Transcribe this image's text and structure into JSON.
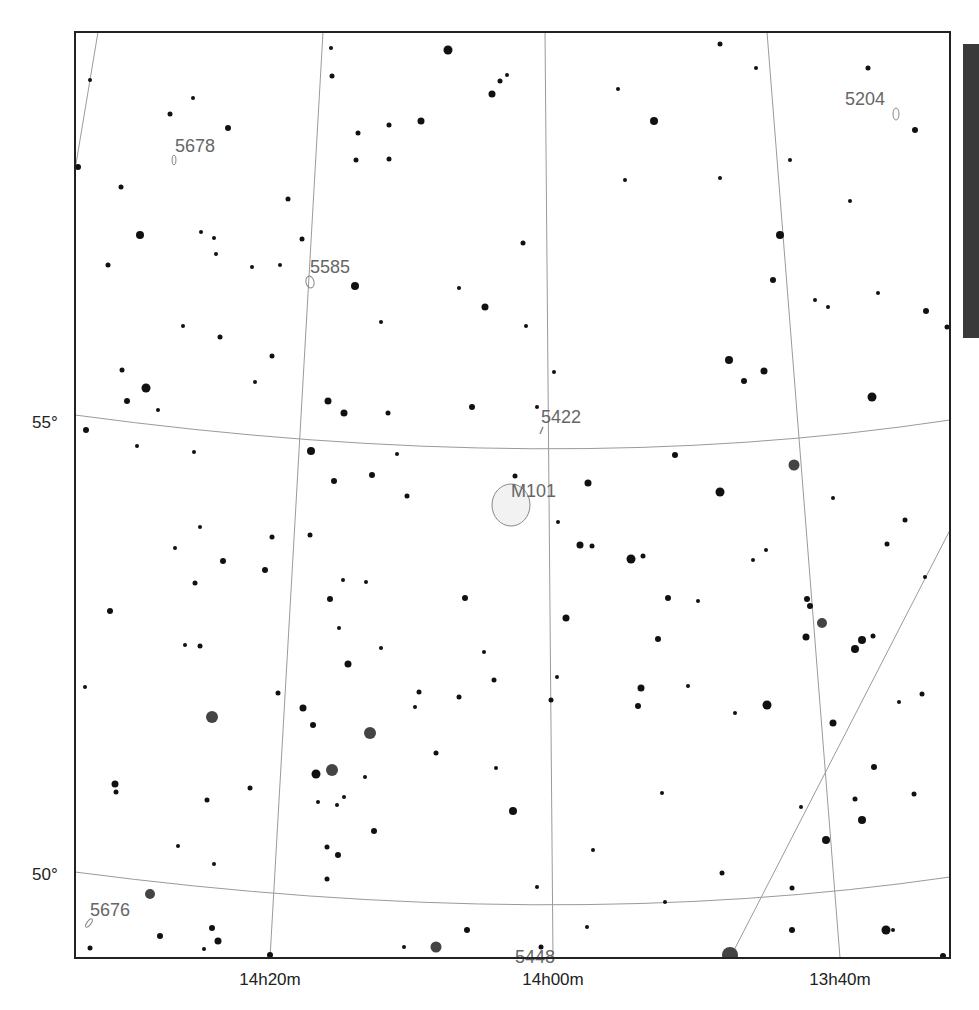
{
  "chart": {
    "frame": {
      "x": 75,
      "y": 32,
      "w": 875,
      "h": 926
    },
    "colors": {
      "frame": "#222222",
      "grid": "#9a9a9a",
      "star": "#111111",
      "star_dim": "#444444",
      "label": "#666666",
      "galaxy_fill": "#f2f2f2",
      "galaxy_stroke": "#888888",
      "side_bar": "#3a3a3a"
    },
    "dec_labels": [
      {
        "text": "55°",
        "x": 32,
        "y": 428
      },
      {
        "text": "50°",
        "x": 32,
        "y": 880
      }
    ],
    "ra_labels": [
      {
        "text": "14h20m",
        "x": 270,
        "y": 985
      },
      {
        "text": "14h00m",
        "x": 553,
        "y": 985
      },
      {
        "text": "13h40m",
        "x": 840,
        "y": 985
      }
    ],
    "grid_lines": [
      {
        "name": "ra-14h30m",
        "d": "M98,32 L75,170"
      },
      {
        "name": "ra-14h20m",
        "d": "M323,32 L270,958"
      },
      {
        "name": "ra-14h00m",
        "d": "M545,32 L553,958"
      },
      {
        "name": "ra-13h40m",
        "d": "M767,32 L840,958"
      },
      {
        "name": "dec-55",
        "d": "M75,415 Q553,480 950,420"
      },
      {
        "name": "dec-50",
        "d": "M75,872 Q553,935 950,877"
      },
      {
        "name": "boundary-line",
        "d": "M730,958 L950,530"
      }
    ],
    "objects": [
      {
        "label": "5678",
        "lx": 175,
        "ly": 152,
        "shape": "ellipse",
        "cx": 174,
        "cy": 160,
        "rx": 2,
        "ry": 5,
        "rot": 0
      },
      {
        "label": "5585",
        "lx": 310,
        "ly": 273,
        "shape": "ellipse",
        "cx": 310,
        "cy": 282,
        "rx": 4,
        "ry": 6,
        "rot": -15
      },
      {
        "label": "5204",
        "lx": 845,
        "ly": 105,
        "shape": "ellipse",
        "cx": 896,
        "cy": 114,
        "rx": 3,
        "ry": 6,
        "rot": 0
      },
      {
        "label": "5422",
        "lx": 541,
        "ly": 423,
        "shape": "line",
        "x1": 540,
        "y1": 434,
        "x2": 543,
        "y2": 427
      },
      {
        "label": "M101",
        "lx": 511,
        "ly": 497,
        "shape": "ellipse",
        "cx": 511,
        "cy": 505,
        "rx": 19,
        "ry": 21,
        "rot": 0
      },
      {
        "label": "5676",
        "lx": 90,
        "ly": 916,
        "shape": "ellipse",
        "cx": 89,
        "cy": 923,
        "rx": 2,
        "ry": 5,
        "rot": 35
      },
      {
        "label": "5448",
        "lx": 515,
        "ly": 963,
        "shape": "none"
      }
    ],
    "stars": [
      [
        90,
        80,
        2
      ],
      [
        170,
        114,
        2.5
      ],
      [
        193,
        98,
        2
      ],
      [
        228,
        128,
        3
      ],
      [
        121,
        187,
        2.5
      ],
      [
        78,
        167,
        3
      ],
      [
        140,
        235,
        4
      ],
      [
        108,
        265,
        2.5
      ],
      [
        201,
        232,
        2
      ],
      [
        214,
        238,
        2
      ],
      [
        216,
        254,
        2
      ],
      [
        252,
        267,
        2
      ],
      [
        288,
        199,
        2.5
      ],
      [
        302,
        239,
        2.5
      ],
      [
        280,
        265,
        2
      ],
      [
        331,
        48,
        2
      ],
      [
        448,
        50,
        4.5
      ],
      [
        332,
        76,
        2.5
      ],
      [
        500,
        81,
        2.5
      ],
      [
        507,
        75,
        2
      ],
      [
        492,
        94,
        3.5
      ],
      [
        421,
        121,
        3.5
      ],
      [
        389,
        125,
        2.5
      ],
      [
        358,
        133,
        2.5
      ],
      [
        356,
        160,
        2.5
      ],
      [
        389,
        159,
        2.5
      ],
      [
        355,
        286,
        4
      ],
      [
        459,
        288,
        2
      ],
      [
        485,
        307,
        3.5
      ],
      [
        381,
        322,
        2
      ],
      [
        526,
        326,
        2
      ],
      [
        523,
        243,
        2.5
      ],
      [
        720,
        44,
        2.5
      ],
      [
        756,
        68,
        2
      ],
      [
        868,
        68,
        2.5
      ],
      [
        915,
        130,
        3
      ],
      [
        654,
        121,
        4
      ],
      [
        618,
        89,
        2
      ],
      [
        625,
        180,
        2
      ],
      [
        720,
        178,
        2
      ],
      [
        790,
        160,
        2
      ],
      [
        850,
        201,
        2
      ],
      [
        780,
        235,
        4
      ],
      [
        773,
        280,
        3
      ],
      [
        815,
        300,
        2
      ],
      [
        828,
        307,
        2
      ],
      [
        878,
        293,
        2
      ],
      [
        926,
        311,
        3
      ],
      [
        947,
        327,
        2.5
      ],
      [
        183,
        326,
        2
      ],
      [
        220,
        337,
        2.5
      ],
      [
        272,
        356,
        2.5
      ],
      [
        255,
        382,
        2
      ],
      [
        122,
        370,
        2.5
      ],
      [
        146,
        388,
        4.5
      ],
      [
        127,
        401,
        3
      ],
      [
        158,
        410,
        2
      ],
      [
        86,
        430,
        3
      ],
      [
        137,
        446,
        2
      ],
      [
        194,
        452,
        2
      ],
      [
        328,
        401,
        3.5
      ],
      [
        344,
        413,
        3.5
      ],
      [
        388,
        413,
        2.5
      ],
      [
        554,
        372,
        2
      ],
      [
        472,
        407,
        3
      ],
      [
        537,
        407,
        2
      ],
      [
        729,
        360,
        4
      ],
      [
        764,
        371,
        3.5
      ],
      [
        744,
        381,
        3
      ],
      [
        872,
        397,
        4.5
      ],
      [
        311,
        451,
        4
      ],
      [
        334,
        481,
        3
      ],
      [
        372,
        475,
        3
      ],
      [
        397,
        454,
        2
      ],
      [
        407,
        496,
        2.5
      ],
      [
        515,
        476,
        2.5
      ],
      [
        588,
        483,
        3.5
      ],
      [
        675,
        455,
        3
      ],
      [
        720,
        492,
        4.5
      ],
      [
        794,
        465,
        5.5
      ],
      [
        833,
        498,
        2
      ],
      [
        905,
        520,
        2.5
      ],
      [
        200,
        527,
        2
      ],
      [
        175,
        548,
        2
      ],
      [
        223,
        561,
        3
      ],
      [
        272,
        537,
        2.5
      ],
      [
        310,
        535,
        2.5
      ],
      [
        265,
        570,
        3
      ],
      [
        195,
        583,
        2.5
      ],
      [
        110,
        611,
        3
      ],
      [
        185,
        645,
        2
      ],
      [
        200,
        646,
        2.5
      ],
      [
        558,
        522,
        2
      ],
      [
        580,
        545,
        3.5
      ],
      [
        592,
        546,
        2.5
      ],
      [
        631,
        559,
        4.5
      ],
      [
        643,
        556,
        2.5
      ],
      [
        753,
        560,
        2
      ],
      [
        766,
        550,
        2
      ],
      [
        887,
        544,
        2.5
      ],
      [
        925,
        577,
        2
      ],
      [
        343,
        580,
        2
      ],
      [
        330,
        599,
        3
      ],
      [
        339,
        628,
        2
      ],
      [
        366,
        582,
        2
      ],
      [
        465,
        598,
        3
      ],
      [
        566,
        618,
        3.5
      ],
      [
        668,
        598,
        3
      ],
      [
        698,
        601,
        2
      ],
      [
        807,
        599,
        3
      ],
      [
        810,
        606,
        3
      ],
      [
        822,
        623,
        5
      ],
      [
        806,
        637,
        3.5
      ],
      [
        658,
        639,
        3
      ],
      [
        862,
        640,
        4
      ],
      [
        855,
        649,
        4
      ],
      [
        873,
        636,
        2.5
      ],
      [
        348,
        664,
        3.5
      ],
      [
        381,
        648,
        2
      ],
      [
        484,
        652,
        2
      ],
      [
        557,
        677,
        2
      ],
      [
        85,
        687,
        2
      ],
      [
        212,
        717,
        6
      ],
      [
        278,
        693,
        2.5
      ],
      [
        303,
        708,
        3.5
      ],
      [
        313,
        725,
        3
      ],
      [
        370,
        733,
        6
      ],
      [
        415,
        707,
        2
      ],
      [
        419,
        692,
        2.5
      ],
      [
        459,
        697,
        2.5
      ],
      [
        494,
        680,
        2.5
      ],
      [
        551,
        700,
        2.5
      ],
      [
        641,
        688,
        3.5
      ],
      [
        638,
        706,
        3
      ],
      [
        688,
        686,
        2
      ],
      [
        735,
        713,
        2
      ],
      [
        767,
        705,
        4.5
      ],
      [
        833,
        723,
        3.5
      ],
      [
        899,
        702,
        2
      ],
      [
        922,
        694,
        2.5
      ],
      [
        115,
        784,
        3.5
      ],
      [
        116,
        792,
        2.5
      ],
      [
        207,
        800,
        2.5
      ],
      [
        250,
        788,
        2.5
      ],
      [
        332,
        770,
        6
      ],
      [
        316,
        774,
        4.5
      ],
      [
        365,
        777,
        2
      ],
      [
        436,
        753,
        2.5
      ],
      [
        496,
        768,
        2
      ],
      [
        513,
        811,
        4
      ],
      [
        318,
        802,
        2
      ],
      [
        344,
        797,
        2
      ],
      [
        337,
        805,
        2
      ],
      [
        374,
        831,
        3
      ],
      [
        662,
        793,
        2
      ],
      [
        801,
        807,
        2
      ],
      [
        874,
        767,
        3
      ],
      [
        855,
        799,
        2.5
      ],
      [
        862,
        820,
        4
      ],
      [
        914,
        794,
        2.5
      ],
      [
        826,
        840,
        4
      ],
      [
        178,
        846,
        2
      ],
      [
        214,
        864,
        2
      ],
      [
        327,
        847,
        2.5
      ],
      [
        338,
        855,
        3
      ],
      [
        327,
        879,
        2.5
      ],
      [
        537,
        887,
        2
      ],
      [
        593,
        850,
        2
      ],
      [
        722,
        873,
        2.5
      ],
      [
        792,
        888,
        2.5
      ],
      [
        150,
        894,
        5
      ],
      [
        160,
        936,
        3
      ],
      [
        212,
        928,
        3
      ],
      [
        218,
        941,
        3.5
      ],
      [
        90,
        948,
        2.5
      ],
      [
        204,
        949,
        2
      ],
      [
        270,
        955,
        3
      ],
      [
        404,
        947,
        2
      ],
      [
        436,
        947,
        5.5
      ],
      [
        467,
        930,
        3
      ],
      [
        541,
        947,
        2.5
      ],
      [
        587,
        927,
        2
      ],
      [
        665,
        902,
        2
      ],
      [
        792,
        930,
        3
      ],
      [
        886,
        930,
        4.5
      ],
      [
        893,
        930,
        2
      ],
      [
        943,
        956,
        3
      ],
      [
        730,
        955,
        8
      ]
    ]
  }
}
